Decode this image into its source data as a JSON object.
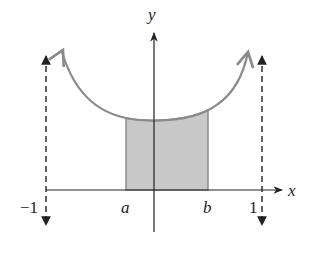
{
  "diagram": {
    "axes": {
      "x_label": "x",
      "y_label": "y"
    },
    "tick_labels": {
      "left_asymptote": "−1",
      "a": "a",
      "b": "b",
      "right_asymptote": "1"
    },
    "colors": {
      "curve": "#8a8a8a",
      "shade_fill": "#c8c8c8",
      "shade_stroke": "#8a8a8a",
      "axis": "#222222",
      "asymptote": "#222222"
    }
  }
}
